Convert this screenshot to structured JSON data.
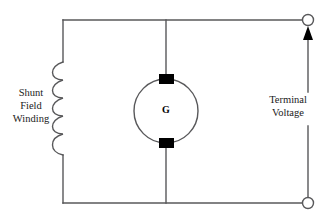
{
  "diagram": {
    "background_color": "#ffffff",
    "wire_color": "#58585a",
    "fill_color": "#000000",
    "labels": {
      "shunt_field_winding": {
        "line1": "Shunt",
        "line2": "Field",
        "line3": "Winding"
      },
      "terminal_voltage": {
        "line1": "Terminal",
        "line2": "Voltage"
      },
      "generator": "G"
    },
    "components": [
      {
        "name": "shunt-field-winding-coil",
        "type": "coil",
        "loops": 5,
        "orientation": "vertical",
        "label": "Shunt Field Winding"
      },
      {
        "name": "generator",
        "type": "machine-circle",
        "symbol": "G",
        "brushes": 2,
        "label": "G"
      },
      {
        "name": "terminal-top",
        "type": "open-terminal",
        "label": "Terminal Voltage"
      },
      {
        "name": "terminal-bottom",
        "type": "open-terminal",
        "label": "Terminal Voltage"
      },
      {
        "name": "voltage-arrow",
        "type": "arrow",
        "direction": "up",
        "label": "Terminal Voltage"
      }
    ]
  }
}
